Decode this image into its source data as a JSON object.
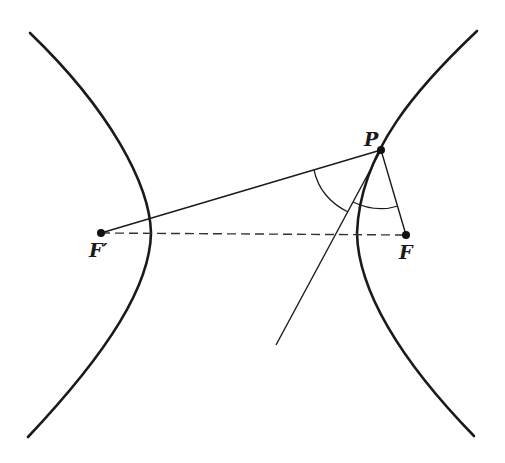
{
  "figure": {
    "labels": {
      "P": "P",
      "F": "F",
      "F_prime": "F′"
    },
    "points": {
      "P": [
        381,
        150
      ],
      "F": [
        406,
        235
      ],
      "F_prime": [
        101,
        233
      ]
    },
    "elements": [
      "left branch",
      "right branch",
      "segment F'P",
      "segment PF",
      "dashed axis F'F",
      "tangent line at P",
      "angle arc at F'P side",
      "angle arc at PF side"
    ]
  }
}
